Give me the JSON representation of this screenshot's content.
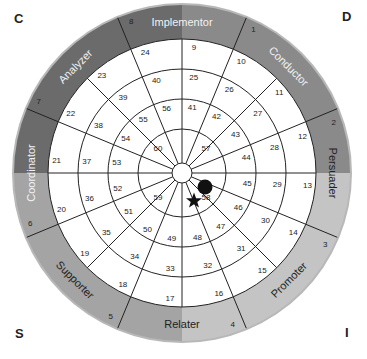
{
  "corners": {
    "top_left": "C",
    "top_right": "D",
    "bottom_left": "S",
    "bottom_right": "I"
  },
  "wheel": {
    "quadrant_colors": {
      "C": "#6b6b6b",
      "D": "#8a8a8a",
      "I": "#c4c4c4",
      "S": "#a4a4a4"
    },
    "rim_color": "#b8b8b8",
    "styles": [
      {
        "label": "Implementor",
        "angle": 0
      },
      {
        "label": "Conductor",
        "angle": 45
      },
      {
        "label": "Persuader",
        "angle": 90
      },
      {
        "label": "Promoter",
        "angle": 135
      },
      {
        "label": "Relater",
        "angle": 180
      },
      {
        "label": "Supporter",
        "angle": 225
      },
      {
        "label": "Coordinator",
        "angle": 270
      },
      {
        "label": "Analyzer",
        "angle": 315
      }
    ],
    "band_numbers": [
      "1",
      "2",
      "3",
      "4",
      "5",
      "6",
      "7",
      "8"
    ],
    "ring_outer_numbers": [
      "9",
      "10",
      "11",
      "12",
      "13",
      "14",
      "15",
      "16",
      "17",
      "18",
      "19",
      "20",
      "21",
      "22",
      "23",
      "24"
    ],
    "ring_second_numbers": [
      "25",
      "26",
      "27",
      "28",
      "29",
      "30",
      "31",
      "32",
      "33",
      "34",
      "35",
      "36",
      "37",
      "38",
      "39",
      "40"
    ],
    "ring_third_numbers": [
      "41",
      "42",
      "43",
      "44",
      "45",
      "46",
      "47",
      "48",
      "49",
      "50",
      "51",
      "52",
      "53",
      "54",
      "55",
      "56"
    ],
    "ring_inner_numbers": [
      "57",
      "58",
      "59",
      "60"
    ],
    "markers": {
      "dot": {
        "segment": "58",
        "color": "#111111"
      },
      "star": {
        "segment": "58",
        "color": "#111111"
      }
    }
  }
}
